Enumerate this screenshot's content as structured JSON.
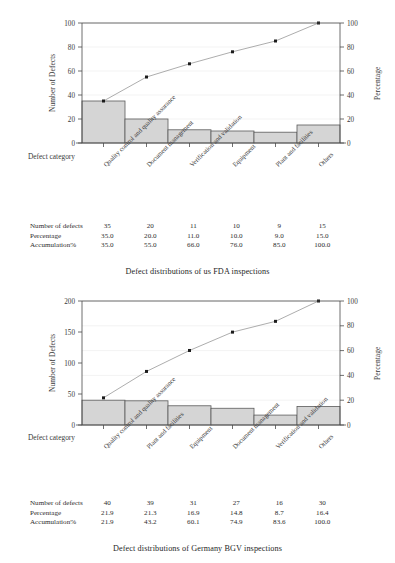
{
  "figure1": {
    "caption": "Defect distributions of us FDA inspections",
    "xaxis_title": "Defect category",
    "yaxis_left": "Number of Defects",
    "yaxis_right": "Percentage",
    "table": {
      "row_labels": [
        "Number of defects",
        "Percentage",
        "Accumulation%"
      ],
      "counts": [
        "35",
        "20",
        "11",
        "10",
        "9",
        "15"
      ],
      "percentage": [
        "35.0",
        "20.0",
        "11.0",
        "10.0",
        "9.0",
        "15.0"
      ],
      "accumulation": [
        "35.0",
        "55.0",
        "66.0",
        "76.0",
        "85.0",
        "100.0"
      ]
    }
  },
  "figure2": {
    "caption": "Defect distributions of Germany BGV inspections",
    "xaxis_title": "Defect category",
    "yaxis_left": "Number of Defects",
    "yaxis_right": "Percentage",
    "table": {
      "row_labels": [
        "Number of defects",
        "Percentage",
        "Accumulation%"
      ],
      "counts": [
        "40",
        "39",
        "31",
        "27",
        "16",
        "30"
      ],
      "percentage": [
        "21.9",
        "21.3",
        "16.9",
        "14.8",
        "8.7",
        "16.4"
      ],
      "accumulation": [
        "21.9",
        "43.2",
        "60.1",
        "74.9",
        "83.6",
        "100.0"
      ]
    }
  },
  "style": {
    "bar_fill": "#d5d5d5",
    "bar_stroke": "#5a5a5a",
    "line_color": "#8a8a8a",
    "marker_color": "#1c1c1c",
    "axis_color": "#4a4a4a",
    "grid_color": "#e6e6e6"
  },
  "chart_data": [
    {
      "type": "bar",
      "title": "Defect distributions of us FDA inspections",
      "xlabel": "Defect category",
      "ylabel": "Number of Defects",
      "y2label": "Percentage",
      "ylim": [
        0,
        100
      ],
      "y2lim": [
        0,
        100
      ],
      "yticks": [
        0,
        20,
        40,
        60,
        80,
        100
      ],
      "y2ticks": [
        0,
        20,
        40,
        60,
        80,
        100
      ],
      "grid": false,
      "legend": "none",
      "categories": [
        "Quality control and quality assurance",
        "Document management",
        "Verification and validation",
        "Equipment",
        "Plant and facilities",
        "Others"
      ],
      "values": [
        35,
        20,
        11,
        10,
        9,
        15
      ],
      "series": [
        {
          "name": "Number of defects",
          "type": "bar",
          "values": [
            35,
            20,
            11,
            10,
            9,
            15
          ]
        },
        {
          "name": "Percentage",
          "type": "value",
          "values": [
            35.0,
            20.0,
            11.0,
            10.0,
            9.0,
            15.0
          ]
        },
        {
          "name": "Accumulation%",
          "type": "line",
          "values": [
            35.0,
            55.0,
            66.0,
            76.0,
            85.0,
            100.0
          ]
        }
      ]
    },
    {
      "type": "bar",
      "title": "Defect distributions of Germany BGV inspections",
      "xlabel": "Defect category",
      "ylabel": "Number of Defects",
      "y2label": "Percentage",
      "ylim": [
        0,
        200
      ],
      "y2lim": [
        0,
        100
      ],
      "yticks": [
        0,
        50,
        100,
        150,
        200
      ],
      "y2ticks": [
        0,
        20,
        40,
        60,
        80,
        100
      ],
      "grid": false,
      "legend": "none",
      "categories": [
        "Quality control and quality assurance",
        "Plant and facilities",
        "Equipment",
        "Document management",
        "Verification and validation",
        "Others"
      ],
      "values": [
        40,
        39,
        31,
        27,
        16,
        30
      ],
      "series": [
        {
          "name": "Number of defects",
          "type": "bar",
          "values": [
            40,
            39,
            31,
            27,
            16,
            30
          ]
        },
        {
          "name": "Percentage",
          "type": "value",
          "values": [
            21.9,
            21.3,
            16.9,
            14.8,
            8.7,
            16.4
          ]
        },
        {
          "name": "Accumulation%",
          "type": "line",
          "values": [
            21.9,
            43.2,
            60.1,
            74.9,
            83.6,
            100.0
          ]
        }
      ]
    }
  ]
}
